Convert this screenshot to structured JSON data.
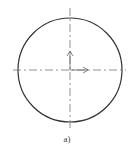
{
  "figure": {
    "caption": "a)",
    "colors": {
      "stroke": "#333333",
      "axis": "#666666",
      "background": "#ffffff"
    },
    "circle": {
      "cx": 70,
      "cy": 70,
      "r": 52
    },
    "axes": {
      "horizontal": {
        "x1": 13,
        "y1": 70,
        "x2": 126,
        "y2": 70,
        "style": "dash-dot"
      },
      "vertical": {
        "x1": 70,
        "y1": 8,
        "x2": 70,
        "y2": 128,
        "style": "dash-dot"
      }
    },
    "arrows": [
      {
        "name": "up-arrow",
        "from": [
          70,
          70
        ],
        "to": [
          70,
          51
        ]
      },
      {
        "name": "right-arrow",
        "from": [
          70,
          70
        ],
        "to": [
          88,
          70
        ]
      }
    ]
  }
}
